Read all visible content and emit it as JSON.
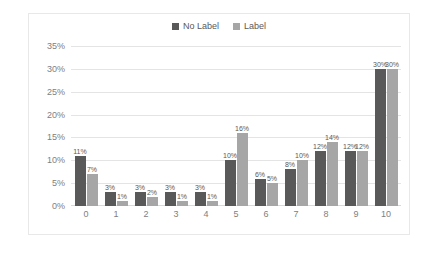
{
  "chart_data": {
    "type": "bar",
    "title": "",
    "xlabel": "",
    "ylabel": "",
    "categories": [
      "0",
      "1",
      "2",
      "3",
      "4",
      "5",
      "6",
      "7",
      "8",
      "9",
      "10"
    ],
    "series": [
      {
        "name": "No Label",
        "color": "#595959",
        "values": [
          11,
          3,
          3,
          3,
          3,
          10,
          6,
          8,
          12,
          12,
          30
        ],
        "labels": [
          "11%",
          "3%",
          "3%",
          "3%",
          "3%",
          "10%",
          "6%",
          "8%",
          "12%",
          "12%",
          "30%"
        ]
      },
      {
        "name": "Label",
        "color": "#a6a6a6",
        "values": [
          7,
          1,
          2,
          1,
          1,
          16,
          5,
          10,
          14,
          12,
          30
        ],
        "labels": [
          "7%",
          "1%",
          "2%",
          "1%",
          "1%",
          "16%",
          "5%",
          "10%",
          "14%",
          "12%",
          "30%"
        ]
      }
    ],
    "ylim": [
      0,
      35
    ],
    "ytick_labels": [
      "35%",
      "30%",
      "25%",
      "20%",
      "15%",
      "10%",
      "5%",
      "0%"
    ],
    "ytick_values": [
      35,
      30,
      25,
      20,
      15,
      10,
      5,
      0
    ],
    "grid": true,
    "legend_position": "top-center",
    "value_labels_shown": true,
    "units": "percent"
  },
  "legend": {
    "items": [
      {
        "label": "No Label",
        "color": "#595959"
      },
      {
        "label": "Label",
        "color": "#a6a6a6"
      }
    ]
  }
}
